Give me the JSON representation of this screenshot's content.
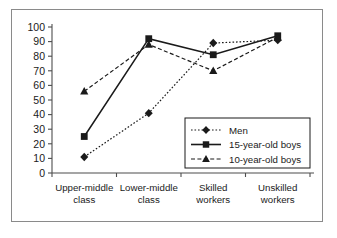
{
  "chart_data": {
    "type": "line",
    "title": "",
    "subtitle": "",
    "xlabel": "",
    "ylabel": "",
    "ylim": [
      0,
      100
    ],
    "ytick_step": 10,
    "yticks": [
      "0",
      "10",
      "20",
      "30",
      "40",
      "50",
      "60",
      "70",
      "80",
      "90",
      "100"
    ],
    "grid": false,
    "legend_position": "inside-lower-right",
    "categories": [
      "Upper-middle class",
      "Lower-middle class",
      "Skilled workers",
      "Unskilled workers"
    ],
    "category_lines": [
      [
        "Upper-middle",
        "class"
      ],
      [
        "Lower-middle",
        "class"
      ],
      [
        "Skilled",
        "workers"
      ],
      [
        "Unskilled",
        "workers"
      ]
    ],
    "series": [
      {
        "name": "Men",
        "marker": "diamond",
        "line_style": "dotted",
        "color": "#1a1a1a",
        "values": [
          11,
          41,
          89,
          91
        ]
      },
      {
        "name": "15-year-old boys",
        "marker": "square",
        "line_style": "solid",
        "color": "#1a1a1a",
        "values": [
          25,
          92,
          81,
          94
        ]
      },
      {
        "name": "10-year-old boys",
        "marker": "triangle",
        "line_style": "dashed",
        "color": "#1a1a1a",
        "values": [
          56,
          88,
          70,
          93
        ]
      }
    ]
  },
  "legend": {
    "entries": [
      {
        "label": "Men"
      },
      {
        "label": "15-year-old boys"
      },
      {
        "label": "10-year-old boys"
      }
    ]
  },
  "colors": {
    "ink": "#1a1a1a",
    "axis": "#4d4d4d",
    "frame": "#8a8a8a",
    "background": "#ffffff"
  }
}
